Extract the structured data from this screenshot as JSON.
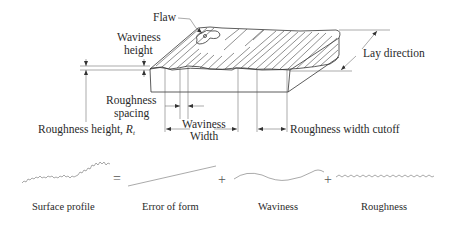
{
  "diagram": {
    "labels": {
      "flaw": "Flaw",
      "waviness_height_line1": "Waviness",
      "waviness_height_line2": "height",
      "lay_direction": "Lay direction",
      "roughness_spacing_line1": "Roughness",
      "roughness_spacing_line2": "spacing",
      "roughness_height_prefix": "Roughness height, ",
      "roughness_height_symbol": "R",
      "roughness_height_subscript": "t",
      "waviness_width_line1": "Waviness",
      "waviness_width_line2": "Width",
      "roughness_width_cutoff": "Roughness width cutoff"
    },
    "decomposition": {
      "operators": [
        "=",
        "+",
        "+"
      ],
      "components": [
        {
          "name": "surface-profile",
          "label": "Surface profile"
        },
        {
          "name": "error-of-form",
          "label": "Error of form"
        },
        {
          "name": "waviness",
          "label": "Waviness"
        },
        {
          "name": "roughness",
          "label": "Roughness"
        }
      ]
    }
  }
}
